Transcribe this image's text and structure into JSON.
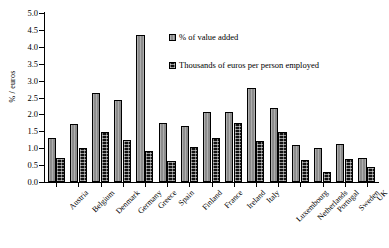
{
  "chart_data": {
    "type": "bar",
    "title": "",
    "xlabel": "",
    "ylabel": "% / euros",
    "ylim": [
      0.0,
      5.0
    ],
    "ytick_step": 0.5,
    "grid": false,
    "legend_position": "inside-upper-center",
    "categories": [
      "Austria",
      "Belgium",
      "Denmark",
      "Germany",
      "Greece",
      "Spain",
      "Finland",
      "France",
      "Ireland",
      "Italy",
      "Luxembourg",
      "Netherlands",
      "Portugal",
      "Sweden",
      "UK"
    ],
    "ytick_labels": [
      "0.0",
      "0.5",
      "1.0",
      "1.5",
      "2.0",
      "2.5",
      "3.0",
      "3.5",
      "4.0",
      "4.5",
      "5.0"
    ],
    "series": [
      {
        "name": "% of value added",
        "color": "#8c8c8c",
        "pattern": "vertical-hatch",
        "values": [
          1.3,
          1.72,
          2.63,
          2.44,
          4.34,
          1.74,
          1.66,
          2.06,
          2.07,
          2.78,
          2.19,
          1.09,
          1.01,
          1.12,
          0.72
        ]
      },
      {
        "name": "Thousands of euros per person employed",
        "color": "#111111",
        "pattern": "dotted-grid",
        "values": [
          0.71,
          1.02,
          1.48,
          1.24,
          0.93,
          0.62,
          1.03,
          1.3,
          1.76,
          1.21,
          1.48,
          0.64,
          0.3,
          0.68,
          0.45
        ]
      }
    ]
  },
  "legend": {
    "items": [
      {
        "label": "% of value added"
      },
      {
        "label": "Thousands of euros per person employed"
      }
    ]
  }
}
